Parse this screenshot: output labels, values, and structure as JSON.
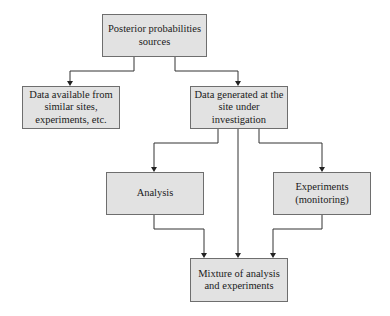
{
  "diagram": {
    "type": "flowchart",
    "colors": {
      "box_fill": "#e2e2e2",
      "box_border": "#6e6e6e",
      "line": "#333333",
      "text": "#1a1a1a"
    },
    "nodes": {
      "root": {
        "label": "Posterior probabilities\nsources"
      },
      "similar_sites": {
        "label": "Data available from\nsimilar sites,\nexperiments, etc."
      },
      "site_data": {
        "label": "Data generated at the\nsite under\ninvestigation"
      },
      "analysis": {
        "label": "Analysis"
      },
      "experiments": {
        "label": "Experiments\n(monitoring)"
      },
      "mixture": {
        "label": "Mixture of analysis\nand experiments"
      }
    },
    "edges": [
      {
        "from": "root",
        "to": "similar_sites"
      },
      {
        "from": "root",
        "to": "site_data"
      },
      {
        "from": "site_data",
        "to": "analysis"
      },
      {
        "from": "site_data",
        "to": "mixture"
      },
      {
        "from": "site_data",
        "to": "experiments"
      },
      {
        "from": "analysis",
        "to": "mixture"
      },
      {
        "from": "experiments",
        "to": "mixture"
      }
    ]
  }
}
